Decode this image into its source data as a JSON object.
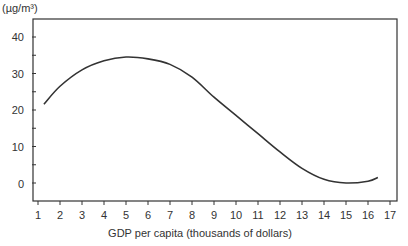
{
  "chart_data": {
    "type": "line",
    "title": "",
    "xlabel": "GDP per capita (thousands of dollars)",
    "ylabel": "(µg/m³)",
    "x_ticks": [
      1,
      2,
      3,
      4,
      5,
      6,
      7,
      8,
      9,
      10,
      11,
      12,
      13,
      14,
      15,
      16,
      17
    ],
    "y_ticks_labeled": [
      0,
      10,
      20,
      30,
      40
    ],
    "y_ticks_minor": [
      5,
      15,
      25,
      35
    ],
    "xlim": [
      0.8,
      17.3
    ],
    "ylim": [
      -5,
      44
    ],
    "grid": false,
    "legend": null,
    "series": [
      {
        "name": "Pollution concentration",
        "x": [
          1.27,
          2,
          3,
          4,
          5,
          6,
          7,
          8,
          9,
          10,
          11,
          12,
          13,
          14,
          15,
          16,
          16.45
        ],
        "y": [
          21.6,
          26.5,
          31,
          33.5,
          34.5,
          34,
          32.5,
          29,
          23.5,
          18.5,
          13.5,
          8.5,
          4,
          1,
          0,
          0.5,
          1.5
        ]
      }
    ],
    "colors": {
      "line": "#333333",
      "axis": "#333333",
      "text": "#333333"
    }
  }
}
